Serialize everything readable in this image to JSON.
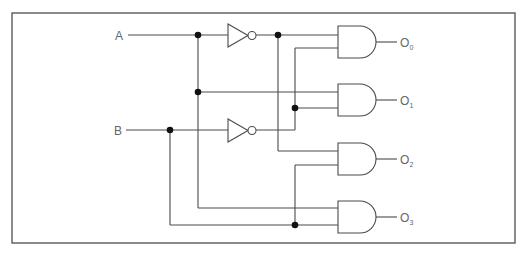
{
  "diagram": {
    "type": "2-to-4 line decoder logic circuit",
    "inputs": [
      {
        "label": "A",
        "y": 35
      },
      {
        "label": "B",
        "y": 130
      }
    ],
    "inverters": [
      {
        "name": "not-a",
        "input": "A",
        "y": 35
      },
      {
        "name": "not-b",
        "input": "B",
        "y": 130
      }
    ],
    "outputs": [
      {
        "label": "O",
        "sub": "0",
        "gate": "AND",
        "inputs": [
          "A",
          "B"
        ]
      },
      {
        "label": "O",
        "sub": "1",
        "gate": "AND",
        "inputs": [
          "A'",
          "B"
        ]
      },
      {
        "label": "O",
        "sub": "2",
        "gate": "AND",
        "inputs": [
          "A",
          "B'"
        ]
      },
      {
        "label": "O",
        "sub": "3",
        "gate": "AND",
        "inputs": [
          "A'",
          "B'"
        ]
      }
    ],
    "colors": {
      "wire": "#4a4a4a",
      "junction": "#111111",
      "label": "#666666",
      "frame": "#5a5a5a"
    }
  }
}
